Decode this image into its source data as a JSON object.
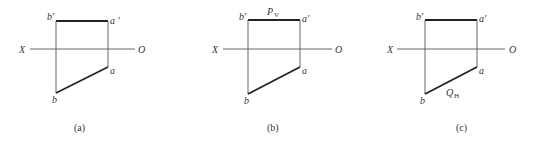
{
  "figure": {
    "panels": [
      {
        "id": "a",
        "caption": "(a)",
        "axis": {
          "left_label": "X",
          "right_label": "O"
        },
        "points": {
          "b_prime": "b′",
          "a_prime": "a ′",
          "a": "a",
          "b": "b"
        },
        "trace_label": null
      },
      {
        "id": "b",
        "caption": "(b)",
        "axis": {
          "left_label": "X",
          "right_label": "O"
        },
        "points": {
          "b_prime": "b′",
          "a_prime": "a′",
          "a": "a",
          "b": "b"
        },
        "trace_label": {
          "main": "P",
          "sub": "V"
        }
      },
      {
        "id": "c",
        "caption": "(c)",
        "axis": {
          "left_label": "X",
          "right_label": "O"
        },
        "points": {
          "b_prime": "b′",
          "a_prime": "a′",
          "a": "a",
          "b": "b"
        },
        "trace_label": {
          "main": "Q",
          "sub": "H"
        }
      }
    ]
  }
}
